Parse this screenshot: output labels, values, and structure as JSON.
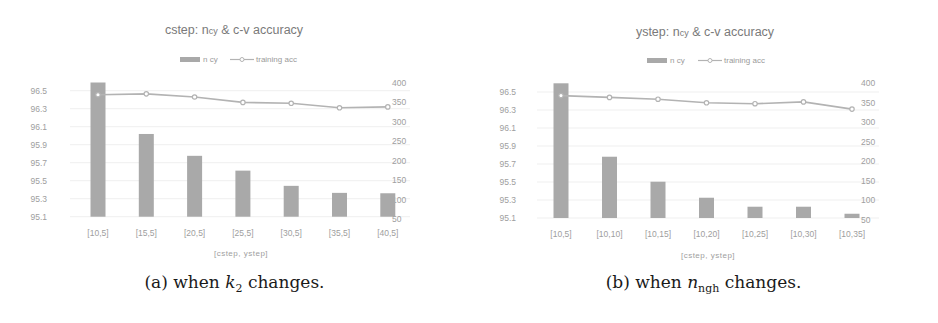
{
  "chart_data": [
    {
      "type": "bar+line",
      "title": "cstep: ncy & c-v accuracy",
      "title_parts": {
        "prefix": "cstep: n",
        "sub": "cy",
        "suffix": " & c-v accuracy"
      },
      "legend": [
        "n cy",
        "training acc"
      ],
      "legend_position": "top",
      "xlabel": "[cstep, ystep]",
      "categories": [
        "[10,5]",
        "[15,5]",
        "[20,5]",
        "[25,5]",
        "[30,5]",
        "[35,5]",
        "[40,5]"
      ],
      "series": [
        {
          "name": "n cy",
          "type": "bar",
          "axis": "right",
          "values": [
            400,
            268,
            212,
            174,
            135,
            117,
            116
          ]
        },
        {
          "name": "training acc",
          "type": "line",
          "axis": "left",
          "values": [
            96.455,
            96.465,
            96.43,
            96.37,
            96.36,
            96.31,
            96.32
          ]
        }
      ],
      "y_left": {
        "ticks": [
          "96.5",
          "96.3",
          "96.1",
          "95.9",
          "95.7",
          "95.5",
          "95.3",
          "95.1"
        ],
        "ylim": [
          95.1,
          96.5
        ]
      },
      "y_right": {
        "ticks": [
          "400",
          "350",
          "300",
          "250",
          "200",
          "150",
          "100",
          "50"
        ],
        "ylim": [
          50,
          400
        ]
      },
      "grid": true,
      "caption": {
        "prefix": "(a) when ",
        "var": "k",
        "sub": "2",
        "suffix": " changes."
      }
    },
    {
      "type": "bar+line",
      "title": "ystep: ncy & c-v accuracy",
      "title_parts": {
        "prefix": "ystep: n",
        "sub": "cy",
        "suffix": " & c-v accuracy"
      },
      "legend": [
        "n cy",
        "training acc"
      ],
      "legend_position": "top",
      "xlabel": "[cstep, ystep]",
      "categories": [
        "[10,5]",
        "[10,10]",
        "[10,15]",
        "[10,20]",
        "[10,25]",
        "[10,30]",
        "[10,35]"
      ],
      "series": [
        {
          "name": "n cy",
          "type": "bar",
          "axis": "right",
          "values": [
            400,
            212,
            148,
            107,
            84,
            84,
            66
          ]
        },
        {
          "name": "training acc",
          "type": "line",
          "axis": "left",
          "values": [
            96.46,
            96.44,
            96.42,
            96.38,
            96.37,
            96.39,
            96.31
          ]
        }
      ],
      "y_left": {
        "ticks": [
          "96.5",
          "96.3",
          "96.1",
          "95.9",
          "95.7",
          "95.5",
          "95.3",
          "95.1"
        ],
        "ylim": [
          95.1,
          96.5
        ]
      },
      "y_right": {
        "ticks": [
          "400",
          "350",
          "300",
          "250",
          "200",
          "150",
          "100",
          "50"
        ],
        "ylim": [
          50,
          400
        ]
      },
      "grid": true,
      "caption": {
        "prefix": "(b) when ",
        "var": "n",
        "sub": "ngh",
        "suffix": " changes."
      }
    }
  ],
  "colors": {
    "bar": "#a9a9a9",
    "line": "#b3b3b3",
    "grid": "#efefef",
    "text": "#9e9e9e"
  }
}
